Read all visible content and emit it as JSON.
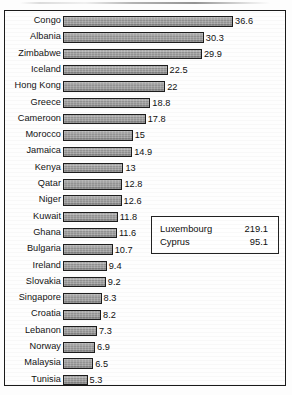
{
  "chart_data": {
    "type": "bar",
    "orientation": "horizontal",
    "title": "",
    "xlabel": "",
    "ylabel": "",
    "xlim": [
      0,
      36.6
    ],
    "grid": false,
    "legend": "none",
    "categories": [
      "Congo",
      "Albania",
      "Zimbabwe",
      "Iceland",
      "Hong Kong",
      "Greece",
      "Cameroon",
      "Morocco",
      "Jamaica",
      "Kenya",
      "Qatar",
      "Niger",
      "Kuwait",
      "Ghana",
      "Bulgaria",
      "Ireland",
      "Slovakia",
      "Singapore",
      "Croatia",
      "Lebanon",
      "Norway",
      "Malaysia",
      "Tunisia"
    ],
    "values": [
      36.6,
      30.3,
      29.9,
      22.5,
      22,
      18.8,
      17.8,
      15,
      14.9,
      13,
      12.8,
      12.6,
      11.8,
      11.6,
      10.7,
      9.4,
      9.2,
      8.3,
      8.2,
      7.3,
      6.9,
      6.5,
      5.3
    ],
    "value_labels": [
      "36.6",
      "30.3",
      "29.9",
      "22.5",
      "22",
      "18.8",
      "17.8",
      "15",
      "14.9",
      "13",
      "12.8",
      "12.6",
      "11.8",
      "11.6",
      "10.7",
      "9.4",
      "9.2",
      "8.3",
      "8.2",
      "7.3",
      "6.9",
      "6.5",
      "5.3"
    ],
    "bar_color": "#9a9a9a",
    "bar_border_color": "#1d1d1d"
  },
  "inset": {
    "rows": [
      {
        "name": "Luxembourg",
        "value": "219.1"
      },
      {
        "name": "Cyprus",
        "value": "95.1"
      }
    ]
  }
}
